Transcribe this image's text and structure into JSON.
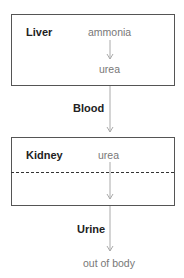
{
  "diagram": {
    "liver": {
      "title": "Liver",
      "input": "ammonia",
      "output": "urea"
    },
    "blood": {
      "label": "Blood"
    },
    "kidney": {
      "title": "Kidney",
      "input": "urea"
    },
    "urine": {
      "label": "Urine"
    },
    "destination": "out of body",
    "colors": {
      "box_border": "#555555",
      "arrow": "#aaaaaa",
      "bold_text": "#222222",
      "light_text": "#777777",
      "dash": "#333333"
    }
  }
}
